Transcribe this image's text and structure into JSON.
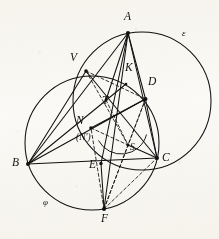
{
  "figure": {
    "kind": "euclidean-geometry-diagram",
    "width": 219,
    "height": 239,
    "stroke_color": "#111111",
    "background_color": "#fbfaf7"
  },
  "points": [
    {
      "id": "A",
      "label": "A",
      "x": 128.0,
      "y": 33.0,
      "label_x": 124.0,
      "label_y": 17.0,
      "marked": true
    },
    {
      "id": "B",
      "label": "B",
      "x": 28.0,
      "y": 164.0,
      "label_x": 13.0,
      "label_y": 163.0,
      "marked": true
    },
    {
      "id": "C",
      "label": "C",
      "x": 157.0,
      "y": 158.0,
      "label_x": 163.0,
      "label_y": 159.0,
      "marked": true
    },
    {
      "id": "D",
      "label": "D",
      "x": 145.5,
      "y": 99.0,
      "label_x": 149.0,
      "label_y": 82.0,
      "marked": true
    },
    {
      "id": "E",
      "label": "E",
      "x": 101.0,
      "y": 163.5,
      "label_x": 90.0,
      "label_y": 165.0,
      "marked": true
    },
    {
      "id": "F",
      "label": "F",
      "x": 104.0,
      "y": 209.0,
      "label_x": 101.0,
      "label_y": 218.0,
      "marked": true
    },
    {
      "id": "K",
      "label": "K",
      "x": 126.0,
      "y": 84.0,
      "label_x": 125.0,
      "label_y": 67.0,
      "marked": false
    },
    {
      "id": "N",
      "label": "N",
      "x": 91.0,
      "y": 128.0,
      "label_x": 76.0,
      "label_y": 121.0,
      "marked": true
    },
    {
      "id": "Nprime",
      "label": "(N')",
      "x": 91.0,
      "y": 128.0,
      "label_x": 78.0,
      "label_y": 137.0,
      "marked": false
    },
    {
      "id": "S",
      "label": "S",
      "x": 128.0,
      "y": 145.0,
      "label_x": 130.0,
      "label_y": 146.0,
      "marked": true
    },
    {
      "id": "T",
      "label": "T",
      "x": 106.0,
      "y": 100.0,
      "label_x": 103.0,
      "label_y": 101.0,
      "marked": true
    },
    {
      "id": "V",
      "label": "V",
      "x": 86.0,
      "y": 71.0,
      "label_x": 71.0,
      "label_y": 58.0,
      "marked": true
    }
  ],
  "circles": [
    {
      "id": "epsilon",
      "label": "ε",
      "cx": 142.0,
      "cy": 101.0,
      "r": 69.0,
      "label_x": 183.0,
      "label_y": 33.0
    },
    {
      "id": "phi",
      "label": "φ",
      "cx": 92.0,
      "cy": 143.0,
      "r": 67.0,
      "label_x": 43.0,
      "label_y": 201.0
    },
    {
      "id": "arc-small",
      "label": "",
      "cx": 121.0,
      "cy": 128.0,
      "r": 26.0,
      "label_x": 0,
      "label_y": 0
    }
  ],
  "solid_segments": [
    {
      "from": "A",
      "to": "B"
    },
    {
      "from": "A",
      "to": "C"
    },
    {
      "from": "A",
      "to": "D"
    },
    {
      "from": "A",
      "to": "E"
    },
    {
      "from": "A",
      "to": "F"
    },
    {
      "from": "A",
      "to": "T"
    },
    {
      "from": "A",
      "to": "N"
    },
    {
      "from": "B",
      "to": "C"
    },
    {
      "from": "B",
      "to": "V"
    },
    {
      "from": "B",
      "to": "K"
    },
    {
      "from": "B",
      "to": "D"
    },
    {
      "from": "B",
      "to": "N"
    },
    {
      "from": "V",
      "to": "C"
    },
    {
      "from": "D",
      "to": "C"
    },
    {
      "from": "D",
      "to": "N"
    },
    {
      "from": "E",
      "to": "F"
    },
    {
      "from": "S",
      "to": "C"
    }
  ],
  "dashed_segments": [
    {
      "from": "V",
      "to": "S"
    },
    {
      "from": "V",
      "to": "D"
    },
    {
      "from": "F",
      "to": "D"
    },
    {
      "from": "F",
      "to": "C"
    },
    {
      "from": "F",
      "to": "S"
    },
    {
      "from": "F",
      "to": "N"
    },
    {
      "from": "D",
      "to": "S"
    },
    {
      "from": "N",
      "to": "S"
    },
    {
      "from": "T",
      "to": "S"
    }
  ],
  "labels": {
    "A": "A",
    "B": "B",
    "C": "C",
    "D": "D",
    "E": "E",
    "F": "F",
    "K": "K",
    "N": "N",
    "Nprime": "(N')",
    "S": "S",
    "T": "T",
    "V": "V",
    "epsilon": "ε",
    "phi": "φ"
  }
}
